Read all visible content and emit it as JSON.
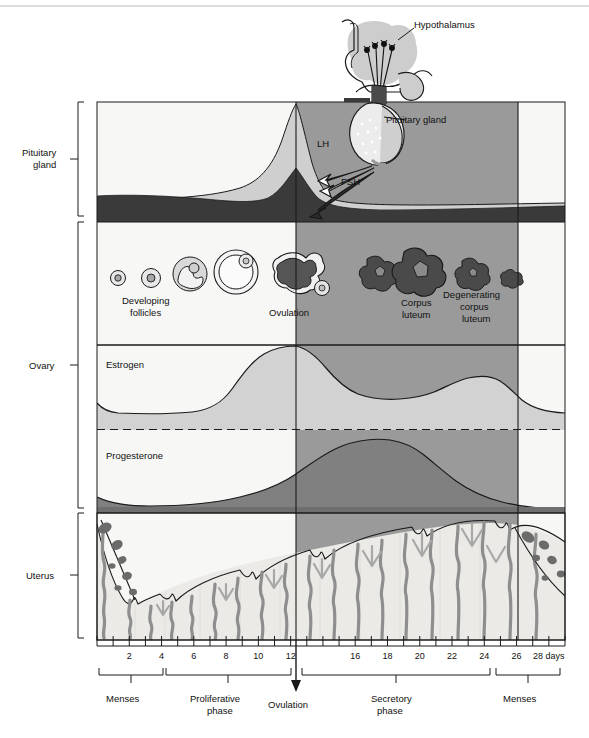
{
  "figure": {
    "sections": [
      {
        "id": "pituitary",
        "label_line1": "Pituitary",
        "label_line2": "gland"
      },
      {
        "id": "ovary",
        "label_line1": "Ovary",
        "label_line2": ""
      },
      {
        "id": "uterus",
        "label_line1": "Uterus",
        "label_line2": ""
      }
    ],
    "callouts": [
      {
        "id": "hypothalamus",
        "text": "Hypothalamus"
      },
      {
        "id": "pituitary-gland",
        "text": "Pituitary gland"
      },
      {
        "id": "lh",
        "text": "LH"
      },
      {
        "id": "fsh",
        "text": "FSH"
      }
    ],
    "ovary_labels": [
      {
        "id": "developing-follicles",
        "line1": "Developing",
        "line2": "follicles"
      },
      {
        "id": "ovulation",
        "line1": "Ovulation",
        "line2": ""
      },
      {
        "id": "corpus-luteum",
        "line1": "Corpus",
        "line2": "luteum"
      },
      {
        "id": "degenerating-corpus-luteum",
        "line1": "Degenerating",
        "line2": "corpus",
        "line3": "luteum"
      }
    ],
    "hormone_labels": [
      {
        "id": "estrogen",
        "text": "Estrogen"
      },
      {
        "id": "progesterone",
        "text": "Progesterone"
      }
    ],
    "phases": [
      {
        "id": "menses-early",
        "line1": "Menses",
        "line2": ""
      },
      {
        "id": "proliferative",
        "line1": "Proliferative",
        "line2": "phase"
      },
      {
        "id": "ovulation-marker",
        "line1": "Ovulation",
        "line2": ""
      },
      {
        "id": "secretory",
        "line1": "Secretory",
        "line2": "phase"
      },
      {
        "id": "menses-late",
        "line1": "Menses",
        "line2": ""
      }
    ],
    "axis": {
      "unit_label": "28 days",
      "tick_labels": [
        "2",
        "4",
        "6",
        "8",
        "10",
        "12",
        "16",
        "18",
        "20",
        "22",
        "24",
        "26",
        "28 days"
      ],
      "tick_values": [
        2,
        4,
        6,
        8,
        10,
        12,
        16,
        18,
        20,
        22,
        24,
        26,
        28
      ],
      "day_min": 0,
      "day_max": 28
    },
    "colors": {
      "page_bg": "#ffffff",
      "panel_white": "#f7f7f5",
      "shade_secretory": "#9a9a9a",
      "light_gray": "#cfcfcf",
      "mid_gray": "#b5b5b5",
      "dark_band": "#3a3a3a",
      "progesterone_fill": "#808080",
      "estrogen_fill": "#d2d2d2",
      "endometrium": "#ebeae6",
      "artery": "#8e8e8e",
      "blood": "#6b6b6b",
      "stroke": "#1a1a1a"
    }
  },
  "chart_data": {
    "type": "line",
    "xlabel": "28 days",
    "ylabel": "",
    "xlim": [
      0,
      28
    ],
    "grid": false,
    "legend": "inline-labels",
    "annotations": [
      {
        "text": "Ovulation",
        "day": 14
      },
      {
        "text": "Menses",
        "day_range": [
          0,
          4
        ]
      },
      {
        "text": "Proliferative phase",
        "day_range": [
          4,
          14
        ]
      },
      {
        "text": "Secretory phase",
        "day_range": [
          14,
          28
        ]
      },
      {
        "text": "Menses",
        "day_range": [
          28,
          30
        ]
      }
    ],
    "series": [
      {
        "name": "LH",
        "x": [
          0,
          2,
          4,
          6,
          8,
          10,
          11,
          12,
          13,
          13.6,
          14,
          14.6,
          15.5,
          17,
          19,
          22,
          25,
          28
        ],
        "values": [
          18,
          16,
          15,
          15,
          16,
          22,
          33,
          52,
          78,
          95,
          100,
          62,
          34,
          20,
          16,
          15,
          16,
          18
        ]
      },
      {
        "name": "FSH",
        "x": [
          0,
          2,
          4,
          6,
          8,
          10,
          12,
          13,
          13.6,
          14,
          15,
          16,
          18,
          21,
          24,
          26,
          28
        ],
        "values": [
          26,
          28,
          26,
          23,
          21,
          22,
          30,
          44,
          55,
          58,
          34,
          20,
          15,
          14,
          15,
          17,
          20
        ]
      },
      {
        "name": "Estrogen",
        "x": [
          0,
          1,
          2,
          4,
          6,
          7,
          8,
          9,
          10,
          11,
          12,
          13,
          13.8,
          15,
          16,
          17,
          18,
          19,
          20,
          21,
          22,
          23,
          24,
          25,
          26,
          27,
          28
        ],
        "values": [
          30,
          22,
          18,
          17,
          17,
          18,
          22,
          32,
          48,
          66,
          82,
          93,
          98,
          88,
          70,
          55,
          44,
          38,
          35,
          36,
          41,
          48,
          55,
          60,
          61,
          52,
          33
        ]
      },
      {
        "name": "Progesterone",
        "x": [
          0,
          2,
          4,
          6,
          8,
          10,
          12,
          13,
          14,
          15,
          16,
          17,
          18,
          19,
          20,
          21,
          22,
          23,
          24,
          25,
          26,
          27,
          28
        ],
        "values": [
          10,
          7,
          6,
          6,
          7,
          9,
          14,
          18,
          24,
          36,
          52,
          68,
          82,
          92,
          96,
          94,
          86,
          74,
          60,
          46,
          34,
          24,
          18
        ]
      },
      {
        "name": "Endometrial thickness",
        "x": [
          0,
          1,
          2,
          3,
          4,
          6,
          8,
          10,
          12,
          14,
          16,
          18,
          20,
          22,
          24,
          26,
          27,
          28
        ],
        "values": [
          88,
          55,
          24,
          14,
          14,
          22,
          32,
          42,
          52,
          62,
          70,
          78,
          86,
          92,
          96,
          98,
          92,
          70
        ]
      }
    ]
  }
}
